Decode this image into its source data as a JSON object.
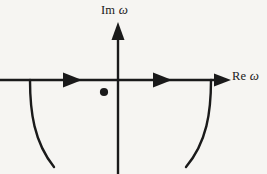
{
  "figure": {
    "kind": "complex-plane-contour-diagram",
    "background_color": "#f6f5f2",
    "ink_color": "#1a1a1a"
  },
  "labels": {
    "imaginary_axis": {
      "prefix": "Im",
      "symbol": "ω"
    },
    "real_axis": {
      "prefix": "Re",
      "symbol": "ω"
    }
  },
  "axes": {
    "real": {
      "name": "real-axis",
      "x_start": 0,
      "x_end": 230,
      "y": 80,
      "arrow_at_end": true,
      "stroke_width": 2.4
    },
    "imaginary": {
      "name": "imaginary-axis",
      "x": 118,
      "y_top": 22,
      "y_bottom": 174,
      "arrow_at_top": true,
      "stroke_width": 2.4
    }
  },
  "direction_arrows": [
    {
      "name": "arrow-left-segment",
      "tip_x": 82,
      "y": 80,
      "direction": "right"
    },
    {
      "name": "arrow-right-segment",
      "tip_x": 172,
      "y": 80,
      "direction": "right"
    }
  ],
  "contour": {
    "left_arc": {
      "name": "contour-left-arc",
      "start": [
        30,
        80
      ],
      "end": [
        54,
        167
      ],
      "stroke_width": 2.4
    },
    "right_arc": {
      "name": "contour-right-arc",
      "start": [
        211,
        80
      ],
      "end": [
        186,
        167
      ],
      "stroke_width": 2.4
    }
  },
  "pole": {
    "name": "pole-marker",
    "cx": 104,
    "cy": 92,
    "r": 4.1,
    "fill": "#1a1a1a"
  }
}
